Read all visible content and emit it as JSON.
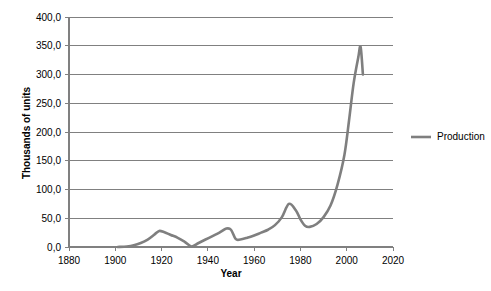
{
  "chart_data": {
    "type": "line",
    "title": "",
    "xlabel": "Year",
    "ylabel": "Thousands of units",
    "xlim": [
      1880,
      2020
    ],
    "ylim": [
      0,
      400
    ],
    "grid": "horizontal",
    "legend_position": "right",
    "x_ticks": [
      "1880",
      "1900",
      "1920",
      "1940",
      "1960",
      "1980",
      "2000",
      "2020"
    ],
    "x_tick_values": [
      1880,
      1900,
      1920,
      1940,
      1960,
      1980,
      2000,
      2020
    ],
    "y_ticks": [
      "0,0",
      "50,0",
      "100,0",
      "150,0",
      "200,0",
      "250,0",
      "300,0",
      "350,0",
      "400,0"
    ],
    "y_tick_values": [
      0,
      50,
      100,
      150,
      200,
      250,
      300,
      350,
      400
    ],
    "decimal_separator": ",",
    "series": [
      {
        "name": "Production",
        "color": "#7f7f7f",
        "x": [
          1901,
          1905,
          1908,
          1911,
          1914,
          1917,
          1919,
          1921,
          1924,
          1927,
          1930,
          1933,
          1936,
          1939,
          1942,
          1945,
          1948,
          1950,
          1952,
          1954,
          1957,
          1960,
          1963,
          1966,
          1969,
          1972,
          1975,
          1978,
          1980,
          1982,
          1984,
          1987,
          1990,
          1993,
          1996,
          1999,
          2001,
          2003,
          2005,
          2006,
          2007
        ],
        "values": [
          0,
          1,
          3,
          7,
          13,
          22,
          28,
          26,
          21,
          16,
          9,
          1,
          7,
          13,
          19,
          25,
          32,
          30,
          14,
          13,
          16,
          20,
          25,
          30,
          38,
          52,
          75,
          64,
          48,
          37,
          35,
          40,
          52,
          72,
          108,
          160,
          220,
          285,
          330,
          348,
          300
        ]
      }
    ]
  },
  "legend": {
    "entries": [
      {
        "label": "Production",
        "color": "#7f7f7f"
      }
    ]
  },
  "axes": {
    "y_axis_title": "Thousands of units",
    "x_axis_title": "Year"
  }
}
